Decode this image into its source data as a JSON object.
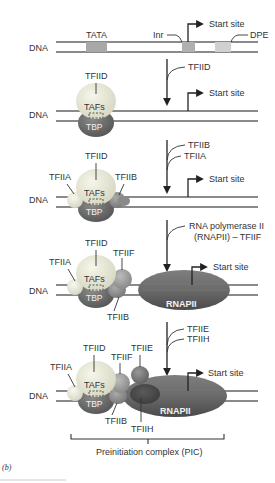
{
  "figure_label": "(b)",
  "colors": {
    "dna": "#8a8a8a",
    "tata_box": "#a8a8a8",
    "inr_box": "#b0b0b0",
    "dpe_box": "#d0d0d0",
    "tfiid": "#e8e8d6",
    "tbp": "#6e6e6e",
    "tfiia": "#ececdc",
    "tfiib": "#8e8e8e",
    "tfiif": "#a0a0a0",
    "tfiie": "#7a7a7a",
    "tfiih": "#4e4e4e",
    "rnapii": "#6a6a6a"
  },
  "stage1": {
    "dna_label": "DNA",
    "tata_label": "TATA",
    "inr_label": "Inr",
    "dpe_label": "DPE",
    "start_label": "Start site"
  },
  "step1": {
    "factor": "TFIID"
  },
  "stage2": {
    "dna_label": "DNA",
    "tfiid_label": "TFIID",
    "tafs_label": "TAFs",
    "tbp_label": "TBP",
    "start_label": "Start site"
  },
  "step2": {
    "factors": [
      "TFIIB",
      "TFIIA"
    ]
  },
  "stage3": {
    "dna_label": "DNA",
    "tfiid_label": "TFIID",
    "tfiia_label": "TFIIA",
    "tfiib_label": "TFIIB",
    "tafs_label": "TAFs",
    "tbp_label": "TBP",
    "start_label": "Start site"
  },
  "step3": {
    "line1": "RNA polymerase II",
    "line2": "(RNAPII) – TFIIF"
  },
  "stage4": {
    "dna_label": "DNA",
    "tfiid_label": "TFIID",
    "tfiia_label": "TFIIA",
    "tfiif_label": "TFIIF",
    "tfiib_label": "TFIIB",
    "tafs_label": "TAFs",
    "tbp_label": "TBP",
    "rnapii_label": "RNAPII",
    "start_label": "Start site"
  },
  "step4": {
    "factors": [
      "TFIIE",
      "TFIIH"
    ]
  },
  "stage5": {
    "dna_label": "DNA",
    "tfiid_label": "TFIID",
    "tfiia_label": "TFIIA",
    "tfiif_label": "TFIIF",
    "tfiie_label": "TFIIE",
    "tfiib_label": "TFIIB",
    "tfiih_label": "TFIIH",
    "tafs_label": "TAFs",
    "tbp_label": "TBP",
    "rnapii_label": "RNAPII",
    "start_label": "Start site"
  },
  "pic_label": "Preinitiation complex (PIC)"
}
